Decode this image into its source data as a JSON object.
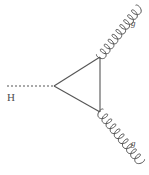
{
  "figure": {
    "kind": "feynman-diagram",
    "background_color": "#ffffff",
    "line_color": "#555555",
    "label_color": "#4d4d4d",
    "width": 149,
    "height": 175
  },
  "labels": {
    "higgs": "H",
    "gluon_upper": "g",
    "gluon_lower": "g"
  },
  "lines": {
    "higgs_propagator": {
      "name": "H",
      "style": "dashed",
      "x1": 7,
      "y1": 86,
      "x2": 54,
      "y2": 86,
      "dash_pattern": "2,2"
    },
    "loop_top_edge": {
      "name": "quark-loop-top",
      "style": "solid",
      "x1": 54,
      "y1": 86,
      "x2": 100,
      "y2": 57
    },
    "loop_bottom_edge": {
      "name": "quark-loop-bottom",
      "style": "solid",
      "x1": 54,
      "y1": 86,
      "x2": 100,
      "y2": 112
    },
    "loop_right_edge": {
      "name": "quark-loop-right",
      "style": "solid",
      "x1": 100,
      "y1": 57,
      "x2": 100,
      "y2": 112
    }
  },
  "gluons": {
    "upper": {
      "name": "gluon-upper",
      "style": "coil",
      "x1": 100,
      "y1": 57,
      "x2": 139,
      "y2": 8,
      "coils": 10,
      "amplitude": 4.4
    },
    "lower": {
      "name": "gluon-lower",
      "style": "coil",
      "x1": 100,
      "y1": 112,
      "x2": 141,
      "y2": 162,
      "coils": 10,
      "amplitude": 4.4
    }
  },
  "vertices": {
    "loop_left": {
      "name": "hgg-vertex-left",
      "x": 54,
      "y": 86
    },
    "loop_top_right": {
      "name": "gluon-vertex-top",
      "x": 100,
      "y": 57
    },
    "loop_bottom_right": {
      "name": "gluon-vertex-bottom",
      "x": 100,
      "y": 112
    }
  }
}
